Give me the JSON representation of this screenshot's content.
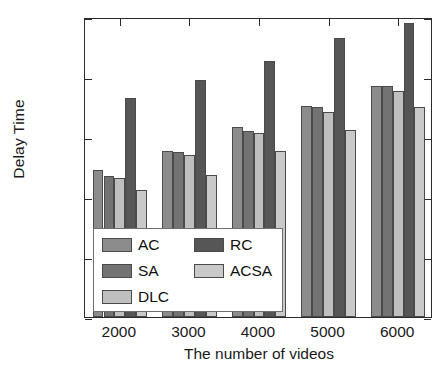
{
  "chart_data": {
    "type": "bar",
    "title": "",
    "subtitle": "",
    "xlabel": "The number of videos",
    "ylabel": "Delay Time",
    "categories": [
      "2000",
      "3000",
      "4000",
      "5000",
      "6000"
    ],
    "xlim": [
      1500,
      6500
    ],
    "ylim": [
      0,
      100
    ],
    "yticks": [
      0,
      20,
      40,
      60,
      80,
      100
    ],
    "ytick_labels": [
      "0",
      "20",
      "40",
      "60",
      "80",
      "100"
    ],
    "xticks": [
      2000,
      3000,
      4000,
      5000,
      6000
    ],
    "xtick_labels": [
      "2000",
      "3000",
      "4000",
      "5000",
      "6000"
    ],
    "grid": false,
    "legend_position": "lower-left-inside",
    "series": [
      {
        "name": "AC",
        "color": "#8c8c8c",
        "values": [
          49,
          55.5,
          63.5,
          70.5,
          77
        ]
      },
      {
        "name": "SA",
        "color": "#737373",
        "values": [
          47,
          55,
          62,
          70,
          77
        ]
      },
      {
        "name": "DLC",
        "color": "#bfbfbf",
        "values": [
          46.5,
          54,
          61.5,
          68.5,
          75.5
        ]
      },
      {
        "name": "RC",
        "color": "#565656",
        "values": [
          73,
          79,
          85.5,
          93,
          98
        ]
      },
      {
        "name": "ACSA",
        "color": "#c9c9c9",
        "values": [
          42.5,
          47.5,
          55.5,
          62.5,
          70
        ]
      }
    ],
    "legend_order": [
      "AC",
      "RC",
      "SA",
      "ACSA",
      "DLC"
    ]
  },
  "axis": {
    "line_color": "#2b2b2b",
    "text_color": "#1a1a1a"
  }
}
